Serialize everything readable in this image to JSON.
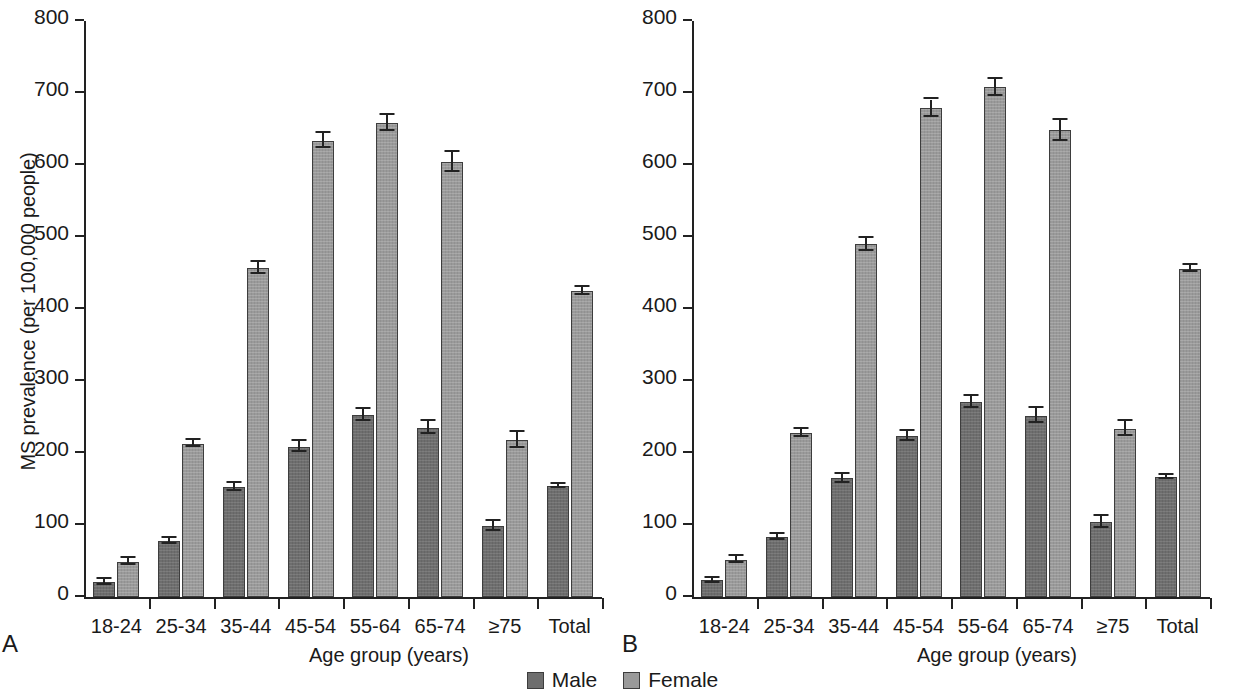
{
  "figure": {
    "legend": [
      {
        "key": "male",
        "label": "Male",
        "color": "#6e6e6e"
      },
      {
        "key": "female",
        "label": "Female",
        "color": "#9a9a9a"
      }
    ],
    "panels": [
      {
        "letter": "A"
      },
      {
        "letter": "B"
      }
    ]
  },
  "chart_data": [
    {
      "type": "bar",
      "panel": "A",
      "title": "",
      "xlabel": "Age group (years)",
      "ylabel": "MS prevalence (per 100,000 people)",
      "ylim": [
        0,
        800
      ],
      "yticks": [
        0,
        100,
        200,
        300,
        400,
        500,
        600,
        700,
        800
      ],
      "grid": false,
      "legend_position": "bottom-center",
      "categories": [
        "18-24",
        "25-34",
        "35-44",
        "45-54",
        "55-64",
        "65-74",
        "≥75",
        "Total"
      ],
      "series": [
        {
          "name": "Male",
          "color": "#6e6e6e",
          "values": [
            21,
            78,
            153,
            209,
            253,
            235,
            98,
            154
          ],
          "errors": [
            4,
            4,
            6,
            7,
            8,
            9,
            7,
            3
          ]
        },
        {
          "name": "Female",
          "color": "#9a9a9a",
          "values": [
            49,
            213,
            457,
            634,
            658,
            604,
            218,
            425
          ],
          "errors": [
            5,
            5,
            8,
            11,
            11,
            14,
            11,
            5
          ]
        }
      ]
    },
    {
      "type": "bar",
      "panel": "B",
      "title": "",
      "xlabel": "Age group (years)",
      "ylabel": "MS prevalence (per 100,000 people)",
      "ylim": [
        0,
        800
      ],
      "yticks": [
        0,
        100,
        200,
        300,
        400,
        500,
        600,
        700,
        800
      ],
      "grid": false,
      "legend_position": "bottom-center",
      "categories": [
        "18-24",
        "25-34",
        "35-44",
        "45-54",
        "55-64",
        "65-74",
        "≥75",
        "Total"
      ],
      "series": [
        {
          "name": "Male",
          "color": "#6e6e6e",
          "values": [
            23,
            83,
            165,
            224,
            271,
            252,
            104,
            167
          ],
          "errors": [
            4,
            4,
            6,
            7,
            8,
            10,
            8,
            3
          ]
        },
        {
          "name": "Female",
          "color": "#9a9a9a",
          "values": [
            52,
            228,
            490,
            679,
            708,
            648,
            234,
            456
          ],
          "errors": [
            5,
            6,
            9,
            12,
            12,
            14,
            11,
            5
          ]
        }
      ]
    }
  ]
}
